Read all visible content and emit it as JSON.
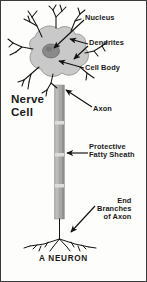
{
  "figure": {
    "title": "Nerve\nCell",
    "caption": "A NEURON",
    "border_color": "#3a3a3a",
    "background_color": "#fdfdfb"
  },
  "labels": [
    {
      "id": "nucleus",
      "text": "Nucleus",
      "name": "label-nucleus"
    },
    {
      "id": "dendrites",
      "text": "Dendrites",
      "name": "label-dendrites"
    },
    {
      "id": "cellbody",
      "text": "Cell Body",
      "name": "label-cell-body"
    },
    {
      "id": "axon",
      "text": "Axon",
      "name": "label-axon"
    },
    {
      "id": "sheath",
      "text": "Protective\nFatty Sheath",
      "name": "label-protective-fatty-sheath"
    },
    {
      "id": "endbranch",
      "text": "End\nBranches\nof Axon",
      "name": "label-end-branches-of-axon"
    }
  ],
  "parts": {
    "soma_label": "cell body / soma",
    "nucleus_label": "nucleus",
    "dendrite_label": "dendrites",
    "axon_label": "axon",
    "myelin_label": "myelin sheath segments",
    "terminal_label": "axon terminal branches"
  },
  "colors": {
    "ink": "#1a1a1a",
    "soma_fill": "#c9c9c9",
    "nucleus_fill": "#8a8a8a",
    "axon_fill": "#a8a8a8",
    "axon_light": "#d2d2d2",
    "arrow": "#111111"
  }
}
